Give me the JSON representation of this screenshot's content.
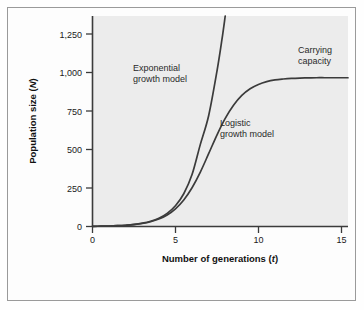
{
  "chart_data": {
    "type": "line",
    "title": "",
    "xlabel": "Number of generations (t)",
    "xlabel_main": "Number of generations (",
    "xlabel_italic": "t",
    "xlabel_tail": ")",
    "ylabel": "Population size (N)",
    "ylabel_main": "Population size (",
    "ylabel_italic": "N",
    "ylabel_tail": ")",
    "xlim": [
      0,
      15.4
    ],
    "ylim": [
      0,
      1330
    ],
    "xticks": [
      0,
      5,
      10,
      15
    ],
    "xtick_labels": [
      "0",
      "5",
      "10",
      "15"
    ],
    "yticks": [
      0,
      250,
      500,
      750,
      1000,
      1250
    ],
    "ytick_labels": [
      "0",
      "250",
      "500",
      "750",
      "1,000",
      "1,250"
    ],
    "grid": false,
    "legend_position": "inline-annotations",
    "carrying_capacity": 940,
    "series": [
      {
        "name": "Exponential growth model",
        "label": "Exponential\ngrowth model",
        "label_line1": "Exponential",
        "label_line2": "growth model",
        "color": "#3b3b3b",
        "x": [
          0,
          0.5,
          1,
          1.5,
          2,
          2.5,
          3,
          3.5,
          4,
          4.5,
          5,
          5.5,
          6,
          6.5,
          7,
          7.5,
          7.8,
          8.0
        ],
        "y": [
          1,
          2,
          3,
          5,
          8,
          13,
          21,
          33,
          52,
          83,
          131,
          207,
          328,
          519,
          700,
          980,
          1180,
          1330
        ]
      },
      {
        "name": "Logistic growth model",
        "label": "Logistic\ngrowth model",
        "label_line1": "Logistic",
        "label_line2": "growth model",
        "color": "#3b3b3b",
        "x": [
          0,
          0.5,
          1,
          1.5,
          2,
          2.5,
          3,
          3.5,
          4,
          4.5,
          5,
          5.5,
          6,
          6.5,
          7,
          7.5,
          8,
          8.5,
          9,
          9.5,
          10,
          10.5,
          11,
          11.5,
          12,
          12.5,
          13,
          13.5,
          14,
          14.5,
          15,
          15.4
        ],
        "y": [
          1,
          2,
          3,
          5,
          8,
          12,
          19,
          30,
          47,
          73,
          112,
          168,
          245,
          344,
          460,
          578,
          683,
          766,
          828,
          870,
          897,
          915,
          926,
          932,
          936,
          938,
          939,
          940,
          940,
          940,
          940,
          940
        ]
      }
    ],
    "annotations": [
      {
        "name": "carrying-capacity-label",
        "line1": "Carrying",
        "line2": "capacity",
        "x": 12.6,
        "y": 1180
      }
    ]
  }
}
